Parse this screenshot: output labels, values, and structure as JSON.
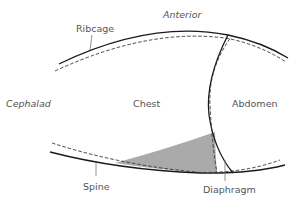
{
  "diagram": {
    "labels": {
      "ribcage": "Ribcage",
      "anterior": "Anterior",
      "cephalad": "Cephalad",
      "chest": "Chest",
      "abdomen": "Abdomen",
      "spine": "Spine",
      "diaphragm": "Diaphragm"
    },
    "line_styles": {
      "solid_meaning": "position A",
      "dashed_meaning": "position B"
    },
    "colors": {
      "line": "#1a1a1a",
      "shaded_region": "#aaaaaa",
      "label_text": "#555555"
    }
  }
}
